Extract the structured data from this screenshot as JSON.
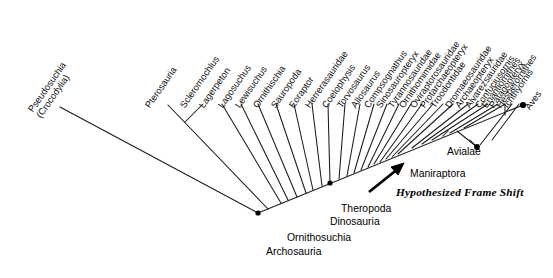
{
  "figure": {
    "type": "cladogram",
    "title": "",
    "orientation": "diagonal-ladderized",
    "line_color": "#1a1a1a",
    "text_color": "#101010",
    "background": "#ffffff"
  },
  "tips": [
    {
      "label": "Pseudosuchia\n(Crocodylia)",
      "index": 0
    },
    {
      "label": "Pterosauria",
      "index": 1
    },
    {
      "label": "Scleromochlus",
      "index": 2
    },
    {
      "label": "Lagerpeton",
      "index": 3
    },
    {
      "label": "Lagosuchus",
      "index": 4
    },
    {
      "label": "Lewisuchus",
      "index": 5
    },
    {
      "label": "Ornithischia",
      "index": 6
    },
    {
      "label": "Sauropoda",
      "index": 7
    },
    {
      "label": "Eoraptor",
      "index": 8
    },
    {
      "label": "Herrerasauridae",
      "index": 9
    },
    {
      "label": "Coelophysis",
      "index": 10
    },
    {
      "label": "Torvosaurus",
      "index": 11
    },
    {
      "label": "Allosaurus",
      "index": 12
    },
    {
      "label": "Compsognathus",
      "index": 13
    },
    {
      "label": "Sinosauropteryx",
      "index": 14
    },
    {
      "label": "Tyrannosauridae",
      "index": 15
    },
    {
      "label": "Ornithomimidae",
      "index": 16
    },
    {
      "label": "Oviraptorosauridae",
      "index": 17
    },
    {
      "label": "Protarchaeopteryx",
      "index": 18
    },
    {
      "label": "Troodontidae",
      "index": 19
    },
    {
      "label": "Dromaeosauridae",
      "index": 20
    },
    {
      "label": "Archaeopteryx",
      "index": 21
    },
    {
      "label": "Alvarezsauridae",
      "index": 22
    },
    {
      "label": "Confuciusornis",
      "index": 23
    },
    {
      "label": "Enantiornithes",
      "index": 24
    },
    {
      "label": "Patagopteryx",
      "index": 25
    },
    {
      "label": "Hesperornithes",
      "index": 26
    },
    {
      "label": "Ichthyornis",
      "index": 27
    },
    {
      "label": "Aves",
      "index": 28
    }
  ],
  "node_labels": [
    {
      "name": "archosauria",
      "label": "Archosauria"
    },
    {
      "name": "ornithosuchia",
      "label": "Ornithosuchia"
    },
    {
      "name": "dinosauria",
      "label": "Dinosauria"
    },
    {
      "name": "theropoda",
      "label": "Theropoda"
    },
    {
      "name": "maniraptora",
      "label": "Maniraptora"
    },
    {
      "name": "avialae",
      "label": "Avialae"
    }
  ],
  "annotation": {
    "label": "Hypothesized Frame Shift",
    "style": "bold-italic-serif",
    "arrow_direction": "up-right"
  }
}
